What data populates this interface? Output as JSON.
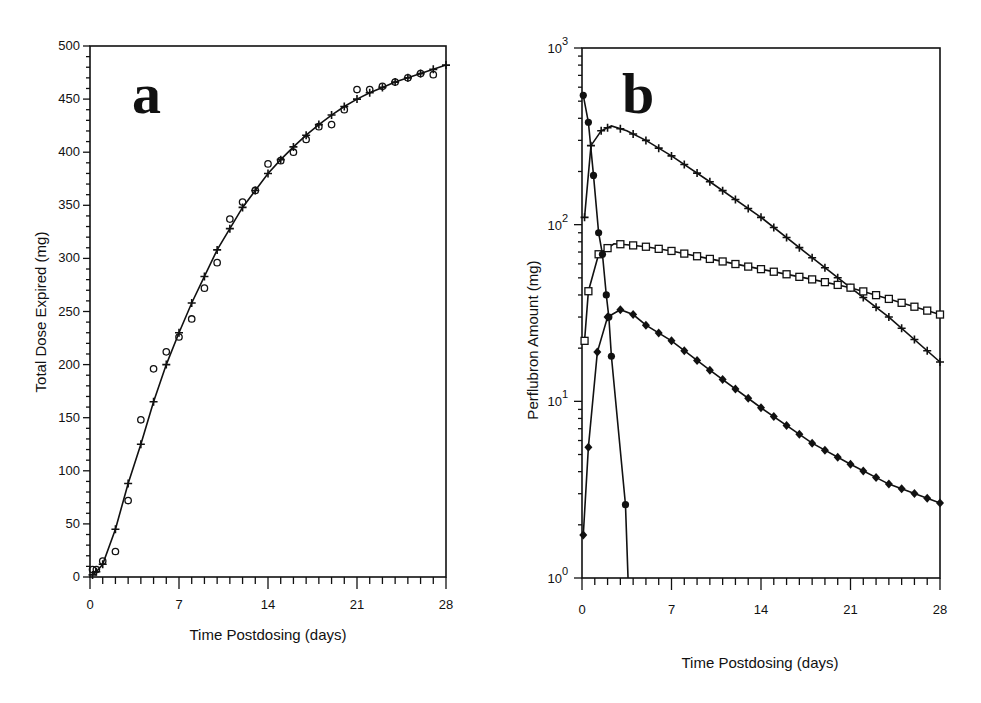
{
  "chart_data": [
    {
      "type": "line",
      "panel_label": "a",
      "title": "",
      "xlabel": "Time Postdosing (days)",
      "ylabel": "Total Dose Expired (mg)",
      "xlim": [
        0,
        28
      ],
      "ylim": [
        0,
        500
      ],
      "xticks": [
        "0",
        "7",
        "14",
        "21",
        "28"
      ],
      "yticks": [
        "0",
        "50",
        "100",
        "150",
        "200",
        "250",
        "300",
        "350",
        "400",
        "450",
        "500"
      ],
      "grid": false,
      "legend": null,
      "series": [
        {
          "name": "Fitted curve with + markers",
          "marker": "plus",
          "x": [
            0.2,
            0.5,
            1,
            2,
            3,
            4,
            5,
            6,
            7,
            8,
            9,
            10,
            11,
            12,
            13,
            14,
            15,
            16,
            17,
            18,
            19,
            20,
            21,
            22,
            23,
            24,
            25,
            26,
            27,
            28
          ],
          "y": [
            2,
            5,
            12,
            45,
            88,
            125,
            165,
            200,
            230,
            258,
            283,
            308,
            328,
            348,
            364,
            380,
            393,
            405,
            416,
            426,
            435,
            443,
            450,
            456,
            461,
            466,
            470,
            474,
            478,
            482
          ]
        },
        {
          "name": "Observed (open circles)",
          "marker": "circle",
          "x": [
            0.2,
            0.5,
            1,
            2,
            3,
            4,
            5,
            6,
            7,
            8,
            9,
            10,
            11,
            12,
            13,
            14,
            15,
            16,
            17,
            18,
            19,
            20,
            21,
            22,
            23,
            24,
            25,
            26,
            27
          ],
          "y": [
            7,
            7,
            15,
            24,
            72,
            148,
            196,
            212,
            226,
            243,
            272,
            296,
            337,
            353,
            364,
            389,
            392,
            400,
            412,
            424,
            426,
            440,
            459,
            459,
            462,
            466,
            470,
            474,
            473
          ]
        }
      ]
    },
    {
      "type": "line",
      "panel_label": "b",
      "title": "",
      "xlabel": "Time Postdosing (days)",
      "ylabel": "Perflubron Amount (mg)",
      "xlim": [
        0,
        28
      ],
      "ylim": [
        1,
        1000
      ],
      "yscale": "log",
      "xticks": [
        "0",
        "7",
        "14",
        "21",
        "28"
      ],
      "yticks": [
        "10^0",
        "10^1",
        "10^2",
        "10^3"
      ],
      "grid": false,
      "legend": null,
      "series": [
        {
          "name": "Plus markers",
          "marker": "plus",
          "x": [
            0.2,
            0.7,
            1.5,
            2.3,
            3.5,
            5,
            7,
            10,
            14,
            18,
            21,
            24,
            28
          ],
          "y": [
            110,
            280,
            340,
            362,
            340,
            300,
            245,
            175,
            110,
            65,
            44,
            30,
            16.7
          ]
        },
        {
          "name": "Square markers",
          "marker": "square",
          "x": [
            0.2,
            0.5,
            1.3,
            2.5,
            3.5,
            5,
            7,
            10,
            14,
            18,
            21,
            24,
            28
          ],
          "y": [
            22,
            42,
            68,
            78,
            77,
            75,
            71,
            64,
            56,
            49,
            44,
            38,
            31
          ]
        },
        {
          "name": "Diamond markers",
          "marker": "diamond",
          "x": [
            0.1,
            0.5,
            1.2,
            2,
            3,
            4,
            5,
            7,
            10,
            14,
            18,
            21,
            24,
            28
          ],
          "y": [
            1.75,
            5.5,
            19,
            30,
            33,
            31,
            27,
            22,
            15,
            9.2,
            5.8,
            4.4,
            3.4,
            2.66
          ]
        },
        {
          "name": "Filled circle markers",
          "marker": "filled-circle",
          "x": [
            0.1,
            0.5,
            0.9,
            1.3,
            1.6,
            1.9,
            2.1,
            2.3,
            3.4,
            3.6
          ],
          "y": [
            540,
            380,
            190,
            90,
            68,
            40,
            30,
            18,
            2.6,
            1.0
          ]
        }
      ]
    }
  ],
  "figure": {
    "panel_a": {
      "label": "a",
      "xlabel": "Time Postdosing (days)",
      "ylabel": "Total Dose Expired (mg)",
      "xticks": [
        "0",
        "7",
        "14",
        "21",
        "28"
      ],
      "yticks": [
        "0",
        "50",
        "100",
        "150",
        "200",
        "250",
        "300",
        "350",
        "400",
        "450",
        "500"
      ]
    },
    "panel_b": {
      "label": "b",
      "xlabel": "Time Postdosing (days)",
      "ylabel": "Perflubron Amount (mg)",
      "xticks": [
        "0",
        "7",
        "14",
        "21",
        "28"
      ],
      "ytick_bases": [
        "10",
        "10",
        "10",
        "10"
      ],
      "ytick_exps": [
        "0",
        "1",
        "2",
        "3"
      ]
    }
  }
}
